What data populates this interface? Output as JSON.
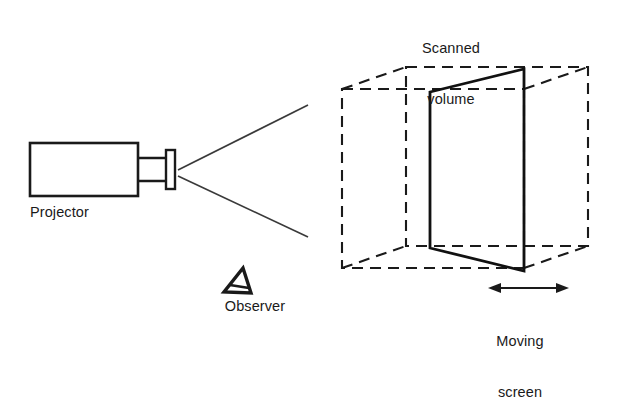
{
  "figure": {
    "type": "diagram",
    "background_color": "#ffffff",
    "line_color": "#1a1a1a"
  },
  "labels": {
    "scanned_volume_line1": "Scanned",
    "scanned_volume_line2": "volume",
    "projector": "Projector",
    "observer": "Observer",
    "moving_line1": "Moving",
    "moving_line2": "screen"
  },
  "icons": {
    "observer_symbol": "observer-eye-triangle-icon",
    "moving_arrow": "double-headed-arrow-icon"
  },
  "geometry": {
    "projector_body": {
      "x": 30,
      "y": 143,
      "w": 108,
      "h": 53
    },
    "projector_neck": {
      "x": 138,
      "y": 158,
      "w": 28,
      "h": 23
    },
    "projector_lens": {
      "x": 166,
      "y": 150,
      "w": 9,
      "h": 39
    },
    "beam_upper": {
      "x1": 178,
      "y1": 170,
      "x2": 308,
      "y2": 105
    },
    "beam_lower": {
      "x1": 178,
      "y1": 176,
      "x2": 308,
      "y2": 237
    },
    "cube_front": {
      "x": 342,
      "y": 89,
      "w": 182,
      "h": 179
    },
    "cube_depth_dx": 64,
    "cube_depth_dy": -22,
    "moving_screen_front_x": 524,
    "moving_screen_back_x": 430,
    "arrow": {
      "x1": 490,
      "y1": 288,
      "x2": 567,
      "y2": 288
    }
  }
}
